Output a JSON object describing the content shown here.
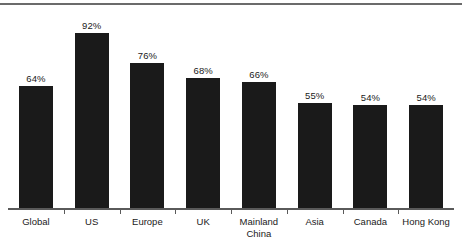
{
  "chart_data": {
    "type": "bar",
    "title": "",
    "subtitle": "",
    "xlabel": "",
    "ylabel": "",
    "ylim": [
      0,
      100
    ],
    "grid": false,
    "legend": false,
    "value_suffix": "%",
    "bar_color": "#1a1a1a",
    "axis_color": "#5a5a5a",
    "rule_color": "#6b6b6b",
    "categories": [
      "Global",
      "US",
      "Europe",
      "UK",
      "Mainland\nChina",
      "Asia",
      "Canada",
      "Hong Kong"
    ],
    "values": [
      64,
      92,
      76,
      68,
      66,
      55,
      54,
      54
    ],
    "labels": [
      "64%",
      "92%",
      "76%",
      "68%",
      "66%",
      "55%",
      "54%",
      "54%"
    ]
  }
}
